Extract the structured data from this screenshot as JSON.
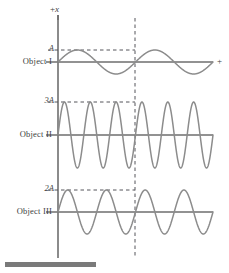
{
  "figure": {
    "title": "",
    "background_color": "#ffffff",
    "curve_color": "#8c8c8c",
    "axis_color": "#6e6e6e",
    "dash_color": "#55555a",
    "text_color": "#3d3d3d",
    "bottom_bar_color": "#7a7a7a"
  },
  "axes": {
    "vertical_axis_label": "+x",
    "vertical_axis_label_sign": "+",
    "vertical_axis_label_variable": "x",
    "horizontal_axis_label": "+"
  },
  "rows": [
    {
      "label": "Object I",
      "amplitude_label": "A",
      "amplitude_value": 1,
      "cycles": 2
    },
    {
      "label": "Object II",
      "amplitude_label": "3A",
      "amplitude_value": 3,
      "cycles": 6
    },
    {
      "label": "Object III",
      "amplitude_label": "2A",
      "amplitude_value": 2,
      "cycles": 4
    }
  ],
  "chart_data": {
    "type": "line",
    "title": "",
    "xlabel": "+",
    "ylabel": "+x",
    "grid": false,
    "legend": "none",
    "x_origin_px": 58,
    "x_end_px": 213,
    "marker_line_x_px": 135,
    "marker_line_style": "dashed",
    "marker_line_meaning": "one period of Object I",
    "series": [
      {
        "name": "Object I",
        "waveform": "sine",
        "amplitude_label": "A",
        "amplitude_units": 1,
        "amplitude_px": 12,
        "cycles_full_range": 2,
        "cycles_to_marker": 1,
        "baseline_y_px": 62,
        "phase": 0,
        "reference_dash_label": "A",
        "reference_dash_y_px": 50
      },
      {
        "name": "Object II",
        "waveform": "sine",
        "amplitude_label": "3A",
        "amplitude_units": 3,
        "amplitude_px": 33,
        "cycles_full_range": 6,
        "cycles_to_marker": 3,
        "baseline_y_px": 135,
        "phase": 0,
        "reference_dash_label": "3A",
        "reference_dash_y_px": 102
      },
      {
        "name": "Object III",
        "waveform": "sine",
        "amplitude_label": "2A",
        "amplitude_units": 2,
        "amplitude_px": 22,
        "cycles_full_range": 4,
        "cycles_to_marker": 2,
        "baseline_y_px": 212,
        "phase": 0,
        "reference_dash_label": "2A",
        "reference_dash_y_px": 190
      }
    ]
  }
}
